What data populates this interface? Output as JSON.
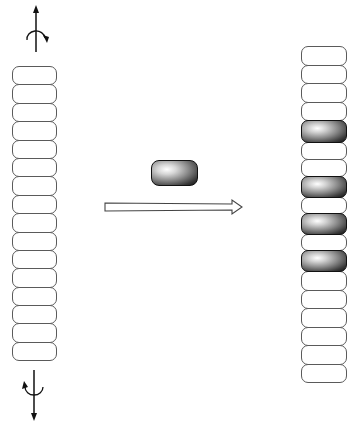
{
  "figure": {
    "colors": {
      "outline": "#5a5a5a",
      "white_block": "#ffffff",
      "dark_block": "#2a2a2a",
      "arrow": "#444444"
    }
  },
  "left_stack": {
    "block_count": 16,
    "blocks": [
      "white",
      "white",
      "white",
      "white",
      "white",
      "white",
      "white",
      "white",
      "white",
      "white",
      "white",
      "white",
      "white",
      "white",
      "white",
      "white"
    ],
    "block_height_px": 19.4
  },
  "right_stack": {
    "block_count": 18,
    "blocks": [
      "white",
      "white",
      "white",
      "white",
      "dark",
      "white",
      "white",
      "dark",
      "white",
      "dark",
      "white",
      "dark",
      "white",
      "white",
      "white",
      "white",
      "white",
      "white"
    ],
    "block_heights_px": [
      19.5,
      19.5,
      19.5,
      19.5,
      23,
      18,
      18,
      22,
      17,
      22,
      17,
      22,
      19.5,
      19.5,
      19.5,
      19.5,
      19.5,
      19.5
    ]
  },
  "insert_block": {
    "type": "dark"
  },
  "process_arrow": {
    "direction": "right",
    "style": "hollow"
  },
  "rotation_axes": [
    {
      "position": "top",
      "arrow": "up",
      "rotation": "clockwise"
    },
    {
      "position": "bottom",
      "arrow": "down",
      "rotation": "counter-clockwise"
    }
  ]
}
